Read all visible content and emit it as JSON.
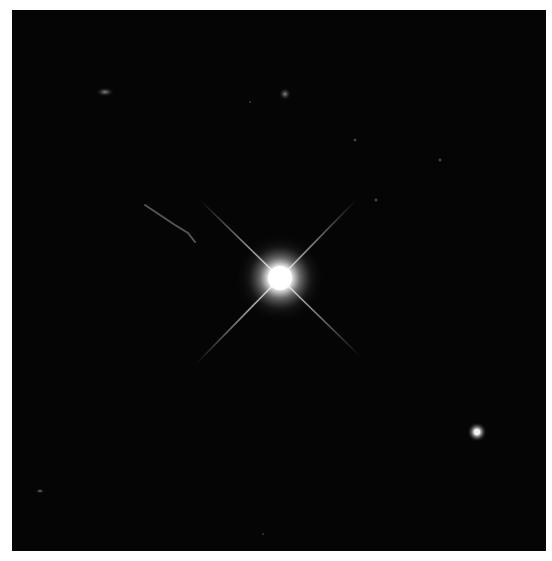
{
  "image": {
    "alt": "Deep-space photograph of a bright star with four diffraction spikes and a fainter companion star",
    "background_color": "#050505",
    "page_background": "#ffffff",
    "frame": {
      "x": 12,
      "y": 10,
      "width": 534,
      "height": 541
    }
  },
  "objects": {
    "primary_star": {
      "label": "bright-star",
      "cx": 280,
      "cy": 278,
      "core_radius": 12,
      "glow_radius": 45,
      "color": "#ffffff"
    },
    "companion_star": {
      "label": "faint-star",
      "cx": 477,
      "cy": 432,
      "core_radius": 3,
      "glow_radius": 10,
      "color": "#f2f2f2"
    },
    "diffraction_spikes": [
      {
        "x1": 200,
        "y1": 200,
        "x2": 360,
        "y2": 356
      },
      {
        "x1": 356,
        "y1": 200,
        "x2": 196,
        "y2": 364
      }
    ],
    "filament": {
      "points": [
        [
          145,
          205
        ],
        [
          160,
          215
        ],
        [
          175,
          225
        ],
        [
          188,
          233
        ],
        [
          195,
          242
        ]
      ]
    },
    "faint_blobs": [
      {
        "cx": 105,
        "cy": 92,
        "rx": 6,
        "ry": 3
      },
      {
        "cx": 285,
        "cy": 94,
        "rx": 4,
        "ry": 4
      },
      {
        "cx": 355,
        "cy": 140,
        "rx": 1.5,
        "ry": 1.5
      },
      {
        "cx": 440,
        "cy": 160,
        "rx": 1.5,
        "ry": 1.5
      },
      {
        "cx": 376,
        "cy": 200,
        "rx": 1.5,
        "ry": 1.5
      },
      {
        "cx": 250,
        "cy": 102,
        "rx": 1,
        "ry": 1
      },
      {
        "cx": 40,
        "cy": 491,
        "rx": 3,
        "ry": 1.5
      },
      {
        "cx": 263,
        "cy": 534,
        "rx": 1,
        "ry": 1
      }
    ]
  }
}
